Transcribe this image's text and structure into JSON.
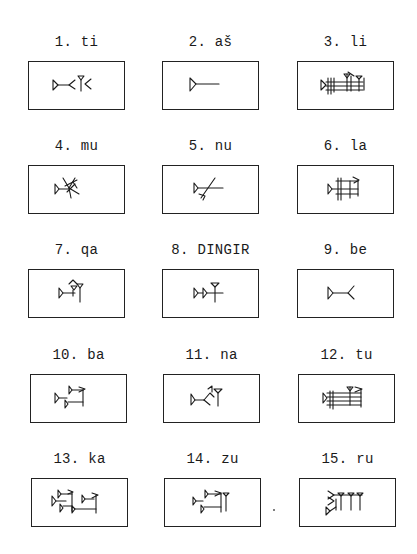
{
  "document": {
    "type": "cuneiform sign list",
    "signs": [
      {
        "number": "1.",
        "reading": "ti",
        "label": "1. ti",
        "glyph": "ti-sign-icon"
      },
      {
        "number": "2.",
        "reading": "aš",
        "label": "2. aš",
        "glyph": "ash-sign-icon"
      },
      {
        "number": "3.",
        "reading": "li",
        "label": "3. li",
        "glyph": "li-sign-icon"
      },
      {
        "number": "4.",
        "reading": "mu",
        "label": "4. mu",
        "glyph": "mu-sign-icon"
      },
      {
        "number": "5.",
        "reading": "nu",
        "label": "5. nu",
        "glyph": "nu-sign-icon"
      },
      {
        "number": "6.",
        "reading": "la",
        "label": "6. la",
        "glyph": "la-sign-icon"
      },
      {
        "number": "7.",
        "reading": "qa",
        "label": "7. qa",
        "glyph": "qa-sign-icon"
      },
      {
        "number": "8.",
        "reading": "DINGIR",
        "label": "8. DINGIR",
        "glyph": "dingir-sign-icon"
      },
      {
        "number": "9.",
        "reading": "be",
        "label": "9. be",
        "glyph": "be-sign-icon"
      },
      {
        "number": "10.",
        "reading": "ba",
        "label": "10. ba",
        "glyph": "ba-sign-icon"
      },
      {
        "number": "11.",
        "reading": "na",
        "label": "11. na",
        "glyph": "na-sign-icon"
      },
      {
        "number": "12.",
        "reading": "tu",
        "label": "12. tu",
        "glyph": "tu-sign-icon"
      },
      {
        "number": "13.",
        "reading": "ka",
        "label": "13. ka",
        "glyph": "ka-sign-icon"
      },
      {
        "number": "14.",
        "reading": "zu",
        "label": "14. zu",
        "glyph": "zu-sign-icon"
      },
      {
        "number": "15.",
        "reading": "ru",
        "label": "15. ru",
        "glyph": "ru-sign-icon"
      }
    ]
  },
  "colors": {
    "ink": "#1a1a1a",
    "paper": "#ffffff"
  }
}
